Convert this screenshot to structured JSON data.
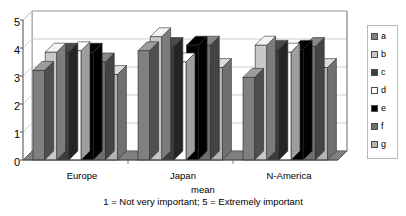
{
  "chart_data": {
    "type": "bar",
    "title": "",
    "subtitle": "",
    "xlabel": "mean",
    "ylabel": "",
    "ylim": [
      0,
      5
    ],
    "yticks": [
      "0",
      "1",
      "2",
      "3",
      "4",
      "5"
    ],
    "grid": true,
    "legend_position": "right",
    "style": "3d-grouped-bar-grayscale",
    "categories": [
      "Europe",
      "Japan",
      "N-America"
    ],
    "series": [
      {
        "name": "a",
        "color": "#808080",
        "values": [
          3.2,
          3.9,
          2.95
        ]
      },
      {
        "name": "b",
        "color": "#c8c8c8",
        "values": [
          3.85,
          4.4,
          4.1
        ]
      },
      {
        "name": "c",
        "color": "#3c3c3c",
        "values": [
          3.85,
          4.05,
          3.95
        ]
      },
      {
        "name": "d",
        "color": "#ffffff",
        "values": [
          3.9,
          3.5,
          3.85
        ]
      },
      {
        "name": "e",
        "color": "#000000",
        "values": [
          3.85,
          4.1,
          3.95
        ]
      },
      {
        "name": "f",
        "color": "#6e6e6e",
        "values": [
          3.5,
          4.1,
          4.05
        ]
      },
      {
        "name": "g",
        "color": "#b4b4b4",
        "values": [
          3.05,
          3.3,
          3.3
        ]
      }
    ],
    "caption_line1": "mean",
    "caption_line2": "1 = Not very important; 5 = Extremely important"
  },
  "legend": {
    "items": [
      {
        "label": "a"
      },
      {
        "label": "b"
      },
      {
        "label": "c"
      },
      {
        "label": "d"
      },
      {
        "label": "e"
      },
      {
        "label": "f"
      },
      {
        "label": "g"
      }
    ]
  },
  "axis": {
    "y_tick_labels": [
      "5",
      "4",
      "3",
      "2",
      "1",
      "0"
    ],
    "category_labels": [
      "Europe",
      "Japan",
      "N-America"
    ]
  },
  "caption": {
    "line1": "mean",
    "line2": "1 = Not very important; 5 = Extremely important"
  },
  "colors": {
    "plot_background": "#ffffff",
    "floor": "#808080",
    "gridline": "#c0c0c0",
    "axis": "#888888",
    "text": "#000000"
  }
}
